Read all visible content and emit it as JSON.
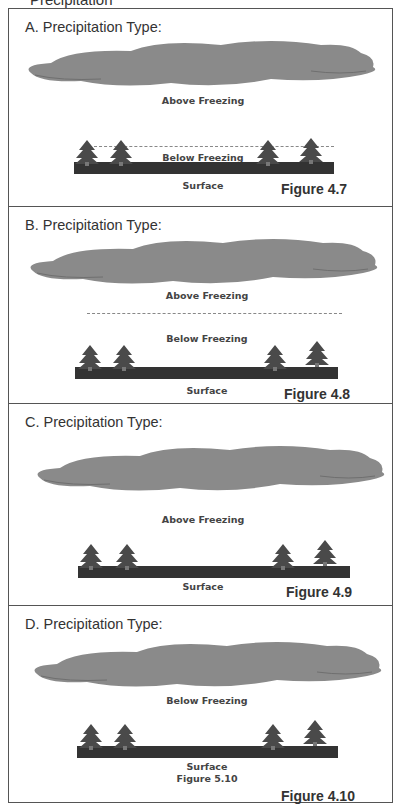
{
  "header_cut": "Precipitation",
  "panels": [
    {
      "id": "A",
      "title": "A.  Precipitation Type:",
      "labels": [
        "Above Freezing",
        "Below Freezing",
        "Surface"
      ],
      "figure": "Figure 4.7"
    },
    {
      "id": "B",
      "title": "B.  Precipitation Type:",
      "labels": [
        "Above Freezing",
        "Below Freezing",
        "Surface"
      ],
      "figure": "Figure 4.8"
    },
    {
      "id": "C",
      "title": "C.  Precipitation Type:",
      "labels": [
        "Above Freezing",
        "Surface"
      ],
      "figure": "Figure 4.9"
    },
    {
      "id": "D",
      "title": "D.  Precipitation Type:",
      "labels": [
        "Below Freezing",
        "Surface",
        "Figure 5.10"
      ],
      "figure": "Figure 4.10"
    }
  ],
  "colors": {
    "cloud": "#888888",
    "ground": "#333333",
    "tree": "#444444",
    "border": "#555555"
  }
}
